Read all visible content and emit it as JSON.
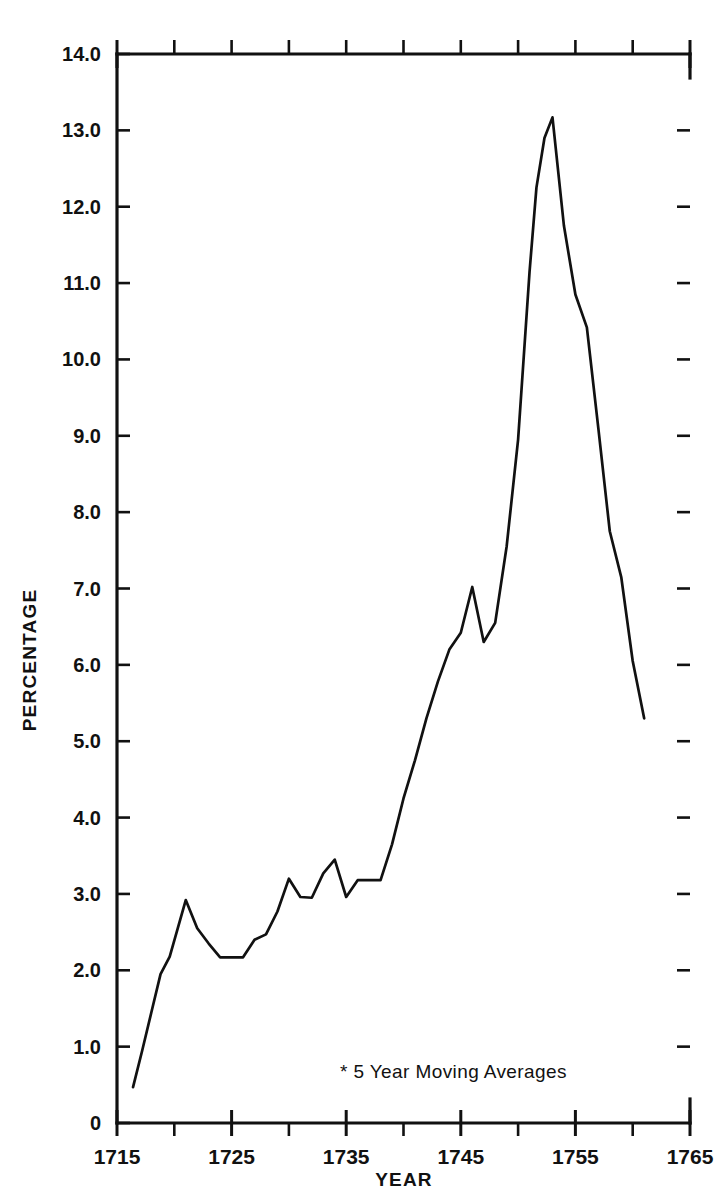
{
  "page": {
    "corner_mark": "",
    "background": "#ffffff",
    "ink": "#111111"
  },
  "chart_data": {
    "type": "line",
    "title": "",
    "subtitle": "",
    "xlabel": "YEAR",
    "ylabel": "PERCENTAGE",
    "xlim": [
      1715,
      1765
    ],
    "ylim": [
      0,
      14
    ],
    "grid": false,
    "legend": null,
    "annotations": [
      "* 5 Year Moving Averages"
    ],
    "x_major_ticks": [
      1715,
      1725,
      1735,
      1745,
      1755,
      1765
    ],
    "x_minor_ticks": [
      1720,
      1730,
      1740,
      1750,
      1760
    ],
    "x_tick_labels": [
      "1715",
      "1725",
      "1735",
      "1745",
      "1755",
      "1765"
    ],
    "y_ticks": [
      0,
      1,
      2,
      3,
      4,
      5,
      6,
      7,
      8,
      9,
      10,
      11,
      12,
      13,
      14
    ],
    "y_tick_labels": [
      "0",
      "1.0",
      "2.0",
      "3.0",
      "4.0",
      "5.0",
      "6.0",
      "7.0",
      "8.0",
      "9.0",
      "10.0",
      "11.0",
      "12.0",
      "13.0",
      "14.0"
    ],
    "series": [
      {
        "name": "Percentage (5 year moving average)",
        "color": "#111111",
        "x": [
          1716.4,
          1717.2,
          1718.0,
          1718.8,
          1719.6,
          1720.3,
          1721.0,
          1722.0,
          1723.0,
          1724.0,
          1725.0,
          1726.0,
          1727.0,
          1728.0,
          1729.0,
          1730.0,
          1731.0,
          1732.0,
          1733.0,
          1734.0,
          1735.0,
          1736.0,
          1737.0,
          1738.0,
          1739.0,
          1740.0,
          1741.0,
          1742.0,
          1743.0,
          1744.0,
          1745.0,
          1746.0,
          1747.0,
          1748.0,
          1749.0,
          1750.0,
          1751.0,
          1751.6,
          1752.3,
          1753.0,
          1754.0,
          1755.0,
          1756.0,
          1757.0,
          1758.0,
          1759.0,
          1760.0,
          1761.0
        ],
        "y": [
          0.47,
          0.95,
          1.45,
          1.95,
          2.18,
          2.55,
          2.92,
          2.55,
          2.35,
          2.17,
          2.17,
          2.17,
          2.4,
          2.47,
          2.77,
          3.2,
          2.96,
          2.95,
          3.27,
          3.45,
          2.96,
          3.18,
          3.18,
          3.18,
          3.65,
          4.25,
          4.75,
          5.3,
          5.78,
          6.2,
          6.42,
          7.02,
          6.3,
          6.55,
          7.55,
          8.95,
          11.15,
          12.25,
          12.9,
          13.17,
          11.75,
          10.85,
          10.42,
          9.1,
          7.75,
          7.15,
          6.05,
          5.3
        ]
      }
    ]
  },
  "axis_titles": {
    "y": "PERCENTAGE",
    "x": "YEAR"
  },
  "note": "* 5 Year Moving Averages"
}
